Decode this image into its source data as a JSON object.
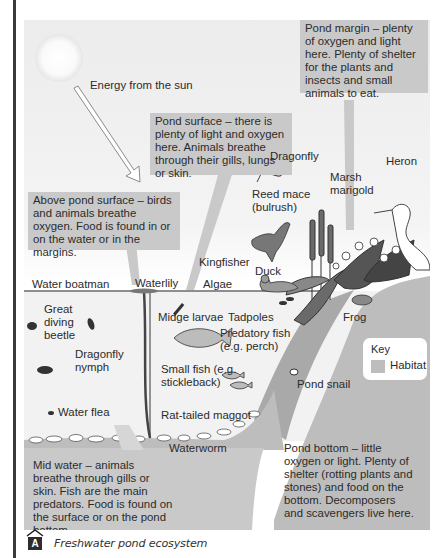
{
  "figure": {
    "caption_letter": "A",
    "caption": "Freshwater pond ecosystem",
    "sun_label": "Energy from the sun",
    "boxes": {
      "pond_margin": "Pond margin – plenty of oxygen and light here. Plenty of shelter for the plants and insects and small animals to eat.",
      "pond_surface": "Pond surface – there is plenty of light and oxygen here. Animals breathe through their gills, lungs or skin.",
      "above_surface": "Above pond surface – birds and animals breathe oxygen. Food is found in or on the water or in the margins.",
      "mid_water": "Mid water – animals breathe through gills or skin. Fish are the main predators. Food is found on the surface or on the pond bottom.",
      "pond_bottom": "Pond bottom – little oxygen or light. Plenty of shelter (rotting plants and stones) and food on the bottom. Decomposers and scavengers live here."
    },
    "organisms": {
      "dragonfly": "Dragonfly",
      "heron": "Heron",
      "marsh_marigold": "Marsh marigold",
      "reed_mace": "Reed mace (bulrush)",
      "kingfisher": "Kingfisher",
      "water_boatman": "Water boatman",
      "waterlily": "Waterlily",
      "algae": "Algae",
      "duck": "Duck",
      "great_diving_beetle": "Great diving beetle",
      "midge_larvae": "Midge larvae",
      "tadpoles": "Tadpoles",
      "frog": "Frog",
      "dragonfly_nymph": "Dragonfly nymph",
      "predatory_fish": "Predatory fish (e.g. perch)",
      "small_fish": "Small fish (e.g. stickleback)",
      "pond_snail": "Pond snail",
      "water_flea": "Water flea",
      "rat_tailed_maggot": "Rat-tailed maggot",
      "waterworm": "Waterworm"
    },
    "key": {
      "title": "Key",
      "habitat": "Habitat",
      "habitat_color": "#bdbdbd"
    }
  }
}
